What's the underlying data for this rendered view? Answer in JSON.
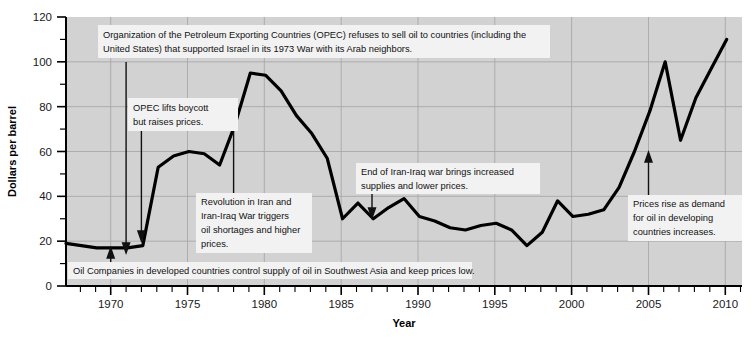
{
  "chart_data": {
    "type": "line",
    "title": "",
    "xlabel": "Year",
    "ylabel": "Dollars per barrel",
    "xlim": [
      1968,
      2012
    ],
    "ylim": [
      0,
      120
    ],
    "grid": true,
    "legend": "none",
    "x_ticks_major": [
      1970,
      1975,
      1980,
      1985,
      1990,
      1995,
      2000,
      2005,
      2010
    ],
    "x_tick_labels": [
      "1970",
      "1975",
      "1980",
      "1985",
      "1990",
      "1995",
      "2000",
      "2005",
      "2010"
    ],
    "y_ticks_major": [
      0,
      20,
      40,
      60,
      80,
      100,
      120
    ],
    "y_tick_labels": [
      "0",
      "20",
      "40",
      "60",
      "80",
      "100",
      "120"
    ],
    "y_minor_step": 10,
    "x_minor_step": 1,
    "series": [
      {
        "name": "Crude oil price",
        "units": "Dollars per barrel",
        "x": [
          1968,
          1969,
          1970,
          1971,
          1972,
          1973,
          1974,
          1975,
          1976,
          1977,
          1978,
          1979,
          1980,
          1981,
          1982,
          1983,
          1984,
          1985,
          1986,
          1987,
          1988,
          1989,
          1990,
          1991,
          1992,
          1993,
          1994,
          1995,
          1996,
          1997,
          1998,
          1999,
          2000,
          2001,
          2002,
          2003,
          2004,
          2005,
          2006,
          2007,
          2008,
          2009,
          2010,
          2011
        ],
        "values": [
          19,
          18,
          17,
          17,
          17,
          18,
          53,
          58,
          60,
          59,
          54,
          72,
          95,
          94,
          87,
          76,
          68,
          57,
          30,
          37,
          30,
          35,
          39,
          31,
          29,
          26,
          25,
          27,
          28,
          25,
          18,
          24,
          38,
          31,
          32,
          34,
          44,
          60,
          78,
          100,
          65,
          84,
          97,
          110
        ]
      }
    ],
    "annotations": [
      {
        "id": "opec-embargo",
        "text": "Organization of the Petroleum Exporting Countries (OPEC) refuses to sell oil to countries (including the United States) that supported Israel in its 1973 War with its Arab neighbors.",
        "points_to_year": 1973,
        "points_to_value": 18
      },
      {
        "id": "opec-lifts-boycott",
        "text": "OPEC lifts boycott but raises prices.",
        "points_to_year": 1974,
        "points_to_value": 53
      },
      {
        "id": "iran-revolution",
        "text": "Revolution in Iran and Iran-Iraq War triggers oil shortages and higher prices.",
        "points_to_year": 1979,
        "points_to_value": 72
      },
      {
        "id": "end-iran-iraq-war",
        "text": "End of Iran-Iraq war brings increased supplies and lower prices.",
        "points_to_year": 1988,
        "points_to_value": 30
      },
      {
        "id": "developing-demand",
        "text": "Prices rise as demand for oil in developing countries increases.",
        "points_to_year": 2005,
        "points_to_value": 60
      },
      {
        "id": "oil-companies-control",
        "text": "Oil Companies in developed countries control supply of oil in Southwest Asia and keep prices low.",
        "points_to_year": 1970,
        "points_to_value": 17
      }
    ]
  },
  "colors": {
    "plot_background": "#d2d2d2",
    "line_color": "#000000",
    "grid_color": "#a8a8a8",
    "axis_color": "#000000",
    "annotation_background": "#f2f2f2",
    "text_color": "#111111"
  }
}
